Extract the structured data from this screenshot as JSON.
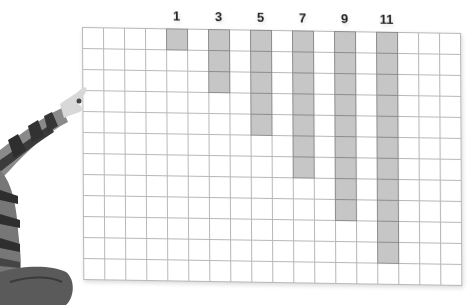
{
  "figure": {
    "grid": {
      "columns": 18,
      "rows": 12,
      "cell_size_px": 21,
      "line_color": "#b8b8b8",
      "shade_color": "#c6c6c6",
      "shade_border_color": "#8c8c8c"
    },
    "bars": [
      {
        "label": "1",
        "column": 4,
        "height": 1
      },
      {
        "label": "3",
        "column": 6,
        "height": 3
      },
      {
        "label": "5",
        "column": 8,
        "height": 5
      },
      {
        "label": "7",
        "column": 10,
        "height": 7
      },
      {
        "label": "9",
        "column": 12,
        "height": 9
      },
      {
        "label": "11",
        "column": 14,
        "height": 11
      }
    ]
  }
}
